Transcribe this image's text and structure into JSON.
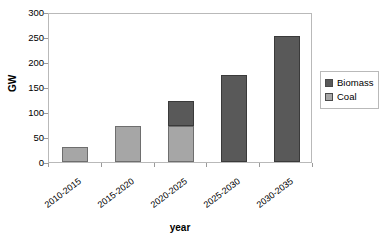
{
  "chart_data": {
    "type": "bar",
    "subtype": "stacked-vertical",
    "title": "",
    "xlabel": "year",
    "ylabel": "GW",
    "categories": [
      "2010-2015",
      "2015-2020",
      "2020-2025",
      "2025-2030",
      "2030-2035"
    ],
    "series": [
      {
        "name": "Coal",
        "color": "#a6a6a6",
        "values": [
          30,
          72,
          72,
          0,
          0
        ]
      },
      {
        "name": "Biomass",
        "color": "#595959",
        "values": [
          0,
          0,
          51,
          175,
          252
        ]
      }
    ],
    "stack_totals": [
      30,
      72,
      123,
      175,
      252
    ],
    "ylim": [
      0,
      300
    ],
    "ytick_step": 50,
    "yticks": [
      0,
      50,
      100,
      150,
      200,
      250,
      300
    ],
    "ytick_labels": [
      "0",
      "50",
      "100",
      "150",
      "200",
      "250",
      "300"
    ],
    "grid": false,
    "legend_position": "right",
    "legend_entries": [
      {
        "label": "Biomass",
        "color": "#595959"
      },
      {
        "label": "Coal",
        "color": "#a6a6a6"
      }
    ],
    "plot_background": "#ffffff",
    "border_color": "#b9b9b9"
  }
}
